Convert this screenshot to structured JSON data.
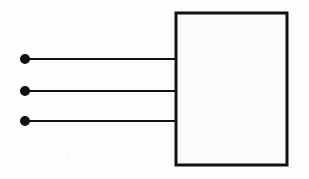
{
  "figure": {
    "kind": "block-diagram",
    "title": "",
    "background_color": "#fdfdfd",
    "stroke_color": "#111111",
    "canvas": {
      "width": 309,
      "height": 179
    }
  },
  "block": {
    "label": "",
    "fill_color": "#fcfcfc",
    "stroke_color": "#111111",
    "stroke_width": 3,
    "x": 176,
    "y": 13,
    "width": 111,
    "height": 152
  },
  "terminals": [
    {
      "name": "terminal-1",
      "cx": 25,
      "cy": 59,
      "r": 5,
      "fill_color": "#111111"
    },
    {
      "name": "terminal-2",
      "cx": 25,
      "cy": 91,
      "r": 5,
      "fill_color": "#111111"
    },
    {
      "name": "terminal-3",
      "cx": 25,
      "cy": 121,
      "r": 5,
      "fill_color": "#111111"
    }
  ],
  "leads": [
    {
      "name": "lead-1",
      "x1": 25,
      "y1": 59,
      "x2": 177,
      "y2": 59,
      "stroke_width": 2,
      "stroke_color": "#111111"
    },
    {
      "name": "lead-2",
      "x1": 25,
      "y1": 91,
      "x2": 177,
      "y2": 91,
      "stroke_width": 2,
      "stroke_color": "#111111"
    },
    {
      "name": "lead-3",
      "x1": 25,
      "y1": 121,
      "x2": 177,
      "y2": 121,
      "stroke_width": 2,
      "stroke_color": "#111111"
    }
  ]
}
